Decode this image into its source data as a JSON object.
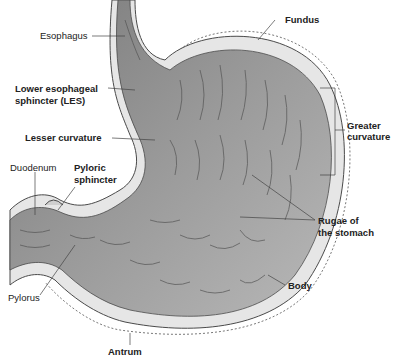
{
  "diagram": {
    "labels": {
      "esophagus": "Esophagus",
      "fundus": "Fundus",
      "les_line1": "Lower esophageal",
      "les_line2": "sphincter (LES)",
      "lesser_curvature": "Lesser curvature",
      "greater_curvature_line1": "Greater",
      "greater_curvature_line2": "curvature",
      "duodenum": "Duodenum",
      "pyloric_sphincter_line1": "Pyloric",
      "pyloric_sphincter_line2": "sphincter",
      "rugae_line1": "Rugae of",
      "rugae_line2": "the stomach",
      "pylorus": "Pylorus",
      "body": "Body",
      "antrum": "Antrum"
    },
    "colors": {
      "outer_wall": "#e6e6e6",
      "inner_lining": "#8c8c8c",
      "inner_lining_light": "#b3b3b3",
      "outline": "#4a4a4a",
      "text": "#222222"
    }
  }
}
